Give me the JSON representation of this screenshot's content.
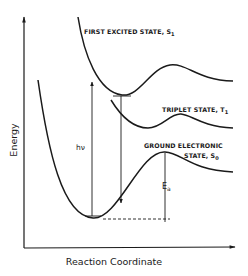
{
  "diagram": {
    "axes": {
      "y_label": "Energy",
      "x_label": "Reaction Coordinate"
    },
    "curves": [
      {
        "id": "s1",
        "label": "FIRST EXCITED STATE, S",
        "subscript": "1"
      },
      {
        "id": "t1",
        "label": "TRIPLET STATE, T",
        "subscript": "1"
      },
      {
        "id": "s0",
        "label_line1": "GROUND ELECTRONIC",
        "label_line2": "STATE, S",
        "subscript": "0"
      }
    ],
    "annotations": {
      "excitation": "hν",
      "activation_energy": "E",
      "activation_energy_subscript": "a"
    },
    "colors": {
      "ink": "#1a1a1a",
      "background": "#ffffff"
    }
  }
}
